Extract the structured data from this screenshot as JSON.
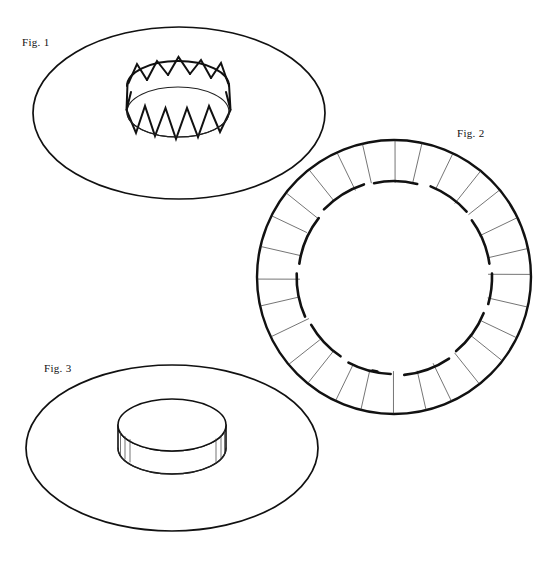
{
  "document": {
    "kind": "patent-figure-sheet",
    "background_color": "#ffffff",
    "ink_color": "#111111",
    "width": 557,
    "height": 562
  },
  "figures": [
    {
      "id": "fig1",
      "label": "Fig. 1",
      "label_x": 22,
      "label_y": 46,
      "description": "Circular disc shown in perspective with an upstanding crenellated crown of pointed teeth at its centre",
      "disc": {
        "cx": 179,
        "cy": 113,
        "rx": 146,
        "ry": 86
      },
      "crown": {
        "cx": 178,
        "cy": 112,
        "rx": 51,
        "ry": 25,
        "height": 38,
        "teeth": 12,
        "tooth_style": "triangular-zigzag"
      }
    },
    {
      "id": "fig2",
      "label": "Fig. 2",
      "label_x": 457,
      "label_y": 137,
      "description": "Plan view of the blank: annular outer ring divided by radial slit lines, with a broken inner circle of arc segments",
      "ring": {
        "cx": 394,
        "cy": 277,
        "r_outer": 137,
        "r_inner": 97
      },
      "radial_lines": 28,
      "inner_arc_segments": 12
    },
    {
      "id": "fig3",
      "label": "Fig. 3",
      "label_x": 44,
      "label_y": 372,
      "description": "Circular disc in perspective with the crown folded down into a smooth closed cylindrical hub at its centre",
      "disc": {
        "cx": 172,
        "cy": 448,
        "rx": 146,
        "ry": 83
      },
      "hub": {
        "cx": 172,
        "cy": 425,
        "rx": 54,
        "ry": 26,
        "height": 41
      }
    }
  ],
  "fig2_geometry": {
    "radial_line_angles_deg": [
      0,
      12.9,
      25.7,
      38.6,
      51.4,
      64.3,
      77.1,
      90,
      102.9,
      115.7,
      128.6,
      141.4,
      154.3,
      167.1,
      180,
      192.9,
      205.7,
      218.6,
      231.4,
      244.3,
      257.1,
      270,
      282.9,
      295.7,
      308.6,
      321.4,
      334.3,
      347.1
    ],
    "inner_arcs_deg": [
      {
        "start": 188,
        "end": 218
      },
      {
        "start": 224,
        "end": 252
      },
      {
        "start": 258,
        "end": 284
      },
      {
        "start": 292,
        "end": 318
      },
      {
        "start": 324,
        "end": 352
      },
      {
        "start": 358,
        "end": 16
      },
      {
        "start": 22,
        "end": 50
      },
      {
        "start": 56,
        "end": 84
      },
      {
        "start": 92,
        "end": 118
      },
      {
        "start": 124,
        "end": 150
      },
      {
        "start": 156,
        "end": 182
      },
      {
        "start": 100,
        "end": 103
      }
    ]
  },
  "fig1_crown_geometry": {
    "tooth_peak_offsets": [
      0,
      30,
      60,
      90,
      120,
      150,
      180,
      210,
      240,
      270,
      300,
      330
    ]
  }
}
